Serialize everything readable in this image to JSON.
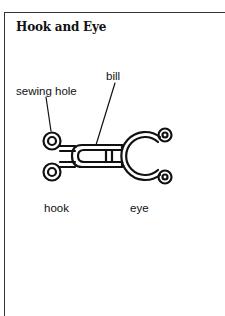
{
  "title": "Hook and Eye",
  "diagram": {
    "callouts": {
      "bill": "bill",
      "sewing_hole": "sewing hole"
    },
    "parts": {
      "hook": "hook",
      "eye": "eye"
    }
  }
}
